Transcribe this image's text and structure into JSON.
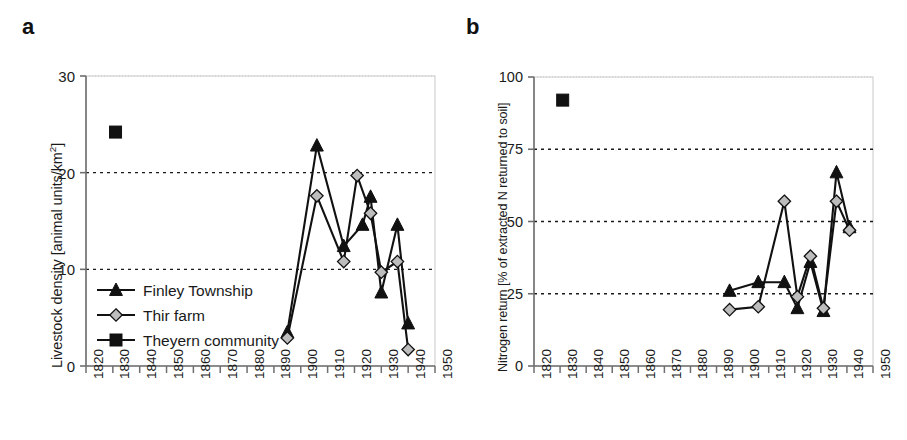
{
  "figure": {
    "panels": [
      {
        "id": "a",
        "label": "a"
      },
      {
        "id": "b",
        "label": "b"
      }
    ]
  },
  "chart_data": [
    {
      "type": "line",
      "panel": "a",
      "title": "",
      "xlabel": "",
      "ylabel": "Livestock density [animal units/km2]",
      "ylabel_base": "Livestock density [animal units/km",
      "ylabel_sup": "2",
      "ylabel_tail": "]",
      "xlim": [
        1820,
        1950
      ],
      "ylim": [
        0,
        30
      ],
      "xticks": [
        1820,
        1830,
        1840,
        1850,
        1860,
        1870,
        1880,
        1890,
        1900,
        1910,
        1920,
        1930,
        1940,
        1950
      ],
      "yticks": [
        0,
        10,
        20,
        30
      ],
      "grid": "horizontal-dotted",
      "legend_position": "inside-lower-left",
      "series": [
        {
          "name": "Finley Township",
          "marker": "filled-triangle",
          "color": "#111111",
          "x": [
            1895,
            1906,
            1916,
            1923,
            1926,
            1930,
            1936,
            1940
          ],
          "values": [
            3.5,
            22.8,
            12.4,
            14.6,
            17.5,
            7.6,
            14.6,
            4.4
          ]
        },
        {
          "name": "Thir farm",
          "marker": "gray-diamond",
          "color": "#b8b8b8",
          "x": [
            1895,
            1906,
            1916,
            1921,
            1926,
            1930,
            1936,
            1940
          ],
          "values": [
            2.9,
            17.6,
            10.8,
            19.7,
            15.8,
            9.7,
            10.8,
            1.7
          ]
        },
        {
          "name": "Theyern community",
          "marker": "filled-square",
          "color": "#111111",
          "x": [
            1831
          ],
          "values": [
            24.2
          ]
        }
      ]
    },
    {
      "type": "line",
      "panel": "b",
      "title": "",
      "xlabel": "",
      "ylabel": "Nitrogen return [% of extracted N returned to soil]",
      "xlim": [
        1820,
        1950
      ],
      "ylim": [
        0,
        100
      ],
      "xticks": [
        1820,
        1830,
        1840,
        1850,
        1860,
        1870,
        1880,
        1890,
        1900,
        1910,
        1920,
        1930,
        1940,
        1950
      ],
      "yticks": [
        0,
        25,
        50,
        75,
        100
      ],
      "grid": "horizontal-dotted",
      "legend_position": "none",
      "series": [
        {
          "name": "Finley Township",
          "marker": "filled-triangle",
          "color": "#111111",
          "x": [
            1895,
            1906,
            1916,
            1921,
            1926,
            1931,
            1936,
            1941
          ],
          "values": [
            26,
            29,
            29,
            20,
            36,
            19,
            67,
            48
          ]
        },
        {
          "name": "Thir farm",
          "marker": "gray-diamond",
          "color": "#b8b8b8",
          "x": [
            1895,
            1906,
            1916,
            1921,
            1926,
            1931,
            1936,
            1941
          ],
          "values": [
            19.5,
            20.5,
            57,
            24,
            38,
            20,
            57,
            47
          ]
        },
        {
          "name": "Theyern community",
          "marker": "filled-square",
          "color": "#111111",
          "x": [
            1831
          ],
          "values": [
            92
          ]
        }
      ]
    }
  ]
}
